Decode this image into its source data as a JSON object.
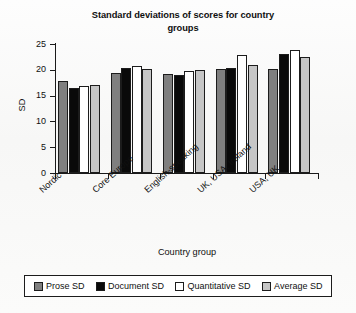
{
  "chart_data": {
    "type": "bar",
    "title": "Standard deviations of scores for country groups",
    "title_line1": "Standard deviations of scores for country",
    "title_line2": "groups",
    "xlabel": "Country group",
    "ylabel": "SD",
    "ylim": [
      0,
      25
    ],
    "yticks": [
      0,
      5,
      10,
      15,
      20,
      25
    ],
    "ytick_labels": [
      "0",
      "5",
      "10",
      "15",
      "20",
      "25"
    ],
    "grid": false,
    "legend_position": "bottom",
    "categories": [
      "Nordic",
      "Core Europe",
      "English-speaking",
      "UK, USA, Ireland",
      "USA, UK"
    ],
    "series": [
      {
        "name": "Prose SD",
        "color": "#7f7f7f",
        "values": [
          17.9,
          19.3,
          19.1,
          20.1,
          20.1
        ]
      },
      {
        "name": "Document SD",
        "color": "#0a0a0a",
        "values": [
          16.5,
          20.3,
          19.0,
          20.3,
          23.1
        ]
      },
      {
        "name": "Quantitative SD",
        "color": "#ffffff",
        "values": [
          16.8,
          20.7,
          19.7,
          22.8,
          23.9
        ]
      },
      {
        "name": "Average SD",
        "color": "#c6c6c6",
        "values": [
          17.1,
          20.1,
          20.0,
          20.9,
          22.4
        ]
      }
    ]
  },
  "legend": {
    "entries": [
      {
        "label": "Prose SD"
      },
      {
        "label": "Document SD"
      },
      {
        "label": "Quantitative SD"
      },
      {
        "label": "Average SD"
      }
    ]
  }
}
